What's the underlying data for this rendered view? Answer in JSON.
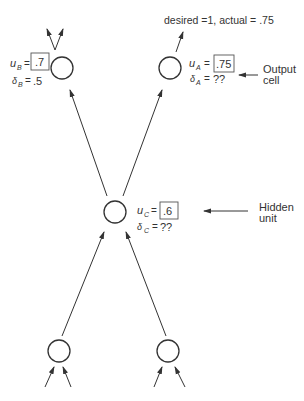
{
  "diagram": {
    "type": "neural-network-backprop",
    "annotation_top": "desired =1, actual = .75",
    "nodes": {
      "B": {
        "u_label": "u",
        "u_sub": "B",
        "u_value": ".7",
        "delta_label": "δ",
        "delta_sub": "B",
        "delta_value": ".5"
      },
      "A": {
        "u_label": "u",
        "u_sub": "A",
        "u_value": ".75",
        "delta_label": "δ",
        "delta_sub": "A",
        "delta_value": "??"
      },
      "C": {
        "u_label": "u",
        "u_sub": "C",
        "u_value": ".6",
        "delta_label": "δ",
        "delta_sub": "C",
        "delta_value": "??"
      }
    },
    "callouts": {
      "output_line1": "Output",
      "output_line2": "cell",
      "hidden_line1": "Hidden",
      "hidden_line2": "unit"
    },
    "equals": "=",
    "colors": {
      "stroke": "#333333",
      "text": "#333333",
      "background": "#ffffff"
    }
  }
}
